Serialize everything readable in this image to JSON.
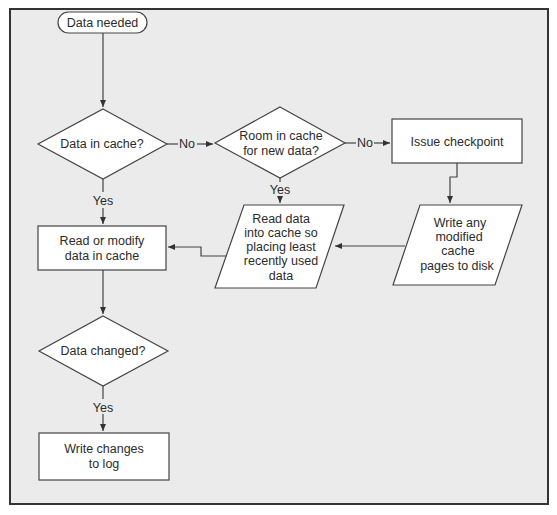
{
  "diagram": {
    "type": "flowchart",
    "title": "",
    "colors": {
      "background": "#ebebeb",
      "frame": "#333333",
      "node_fill": "#ffffff",
      "node_stroke": "#444444",
      "text": "#2b2b2b"
    },
    "nodes": {
      "start": {
        "shape": "terminator",
        "lines": [
          "Data needed"
        ]
      },
      "data_in_cache": {
        "shape": "decision",
        "lines": [
          "Data in cache?"
        ]
      },
      "room_in_cache": {
        "shape": "decision",
        "lines": [
          "Room in cache",
          "for new data?"
        ]
      },
      "issue_checkpoint": {
        "shape": "process",
        "lines": [
          "Issue checkpoint"
        ]
      },
      "write_modified": {
        "shape": "io",
        "lines": [
          "Write any",
          "modified",
          "cache",
          "pages to disk"
        ]
      },
      "read_data": {
        "shape": "io",
        "lines": [
          "Read data",
          "into cache so",
          "placing least",
          "recently used",
          "data"
        ]
      },
      "read_modify": {
        "shape": "process",
        "lines": [
          "Read or modify",
          "data in cache"
        ]
      },
      "data_changed": {
        "shape": "decision",
        "lines": [
          "Data changed?"
        ]
      },
      "write_log": {
        "shape": "process",
        "lines": [
          "Write changes",
          "to log"
        ]
      }
    },
    "edges": [
      {
        "from": "start",
        "to": "data_in_cache",
        "label": ""
      },
      {
        "from": "data_in_cache",
        "to": "room_in_cache",
        "label": "No"
      },
      {
        "from": "data_in_cache",
        "to": "read_modify",
        "label": "Yes"
      },
      {
        "from": "room_in_cache",
        "to": "issue_checkpoint",
        "label": "No"
      },
      {
        "from": "room_in_cache",
        "to": "read_data",
        "label": "Yes"
      },
      {
        "from": "issue_checkpoint",
        "to": "write_modified",
        "label": ""
      },
      {
        "from": "write_modified",
        "to": "read_data",
        "label": ""
      },
      {
        "from": "read_data",
        "to": "read_modify",
        "label": ""
      },
      {
        "from": "read_modify",
        "to": "data_changed",
        "label": ""
      },
      {
        "from": "data_changed",
        "to": "write_log",
        "label": "Yes"
      }
    ],
    "labels": {
      "no_1": "No",
      "no_2": "No",
      "yes_1": "Yes",
      "yes_2": "Yes",
      "yes_3": "Yes"
    }
  }
}
